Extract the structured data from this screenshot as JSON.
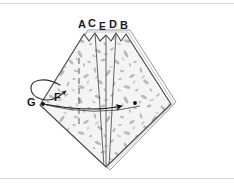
{
  "figure": {
    "kind": "geometry-diagram",
    "background_color": "#ffffff",
    "frame_color": "#d8d8dc",
    "outline_color": "#4a4a4a",
    "fill_color": "#f2f2f2",
    "texture_color": "#a8a8a8",
    "label_color": "#1a1a1a",
    "labels": [
      {
        "id": "A",
        "text": "A",
        "x": 78,
        "y": 19,
        "size": 11
      },
      {
        "id": "C",
        "text": "C",
        "x": 89,
        "y": 20,
        "size": 11
      },
      {
        "id": "E",
        "text": "E",
        "x": 100,
        "y": 24,
        "size": 10
      },
      {
        "id": "D",
        "text": "D",
        "x": 110,
        "y": 21,
        "size": 11
      },
      {
        "id": "B",
        "text": "B",
        "x": 121,
        "y": 21,
        "size": 11
      },
      {
        "id": "G",
        "text": "G",
        "x": 28,
        "y": 97,
        "size": 11
      },
      {
        "id": "F",
        "text": "F",
        "x": 54,
        "y": 93,
        "size": 11
      }
    ],
    "vertices": {
      "top_peaks": [
        {
          "id": "A",
          "x": 84,
          "y": 34
        },
        {
          "id": "C",
          "x": 95,
          "y": 33
        },
        {
          "id": "E",
          "x": 106,
          "y": 35
        },
        {
          "id": "D",
          "x": 116,
          "y": 33
        },
        {
          "id": "B",
          "x": 126,
          "y": 34
        }
      ],
      "left": {
        "id": "G",
        "x": 40,
        "y": 105
      },
      "right": {
        "x": 171,
        "y": 104
      },
      "bottom": {
        "x": 106,
        "y": 167
      }
    },
    "annotations": [
      {
        "name": "rotation-loop-arrow",
        "type": "curved-loop-arrow",
        "description": "counter-clockwise loop at upper-left of vertex G"
      },
      {
        "name": "translation-arrow",
        "type": "straight-arrow",
        "description": "horizontal arrow from G across the body pointing right, terminating with a dot"
      },
      {
        "name": "axis-dashed-line",
        "type": "dashed-vertical",
        "description": "dashed vertical construction line on the left half"
      },
      {
        "name": "center-vertical-line",
        "type": "solid-vertical",
        "description": "solid vertical axis through E down to bottom vertex"
      },
      {
        "name": "point-dot-g",
        "type": "dot",
        "description": "filled dot at vertex G"
      },
      {
        "name": "point-dot-end",
        "type": "dot",
        "description": "filled dot at arrow terminus"
      }
    ]
  }
}
